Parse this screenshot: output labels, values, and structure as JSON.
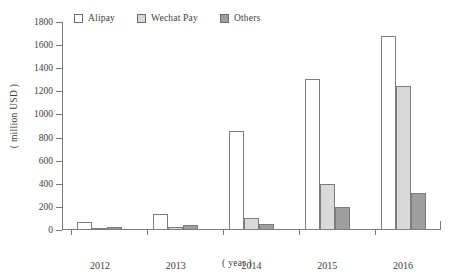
{
  "chart_data": {
    "type": "bar",
    "title": "",
    "subtitle": "",
    "xlabel": "( year )",
    "ylabel": "( million USD )",
    "categories": [
      "2012",
      "2013",
      "2014",
      "2015",
      "2016"
    ],
    "series": [
      {
        "name": "Alipay",
        "values": [
          70,
          140,
          860,
          1310,
          1680
        ]
      },
      {
        "name": "Wechat Pay",
        "values": [
          15,
          30,
          100,
          400,
          1250
        ]
      },
      {
        "name": "Others",
        "values": [
          30,
          40,
          50,
          200,
          320
        ]
      }
    ],
    "ylim": [
      0,
      1800
    ],
    "ytick_values": [
      0,
      200,
      400,
      600,
      800,
      1000,
      1200,
      1400,
      1600,
      1800
    ],
    "ytick_labels": [
      "0",
      "200",
      "400",
      "600",
      "800",
      "1000",
      "1200",
      "1400",
      "1600",
      "1800"
    ],
    "grid": false,
    "legend_position": "top-left",
    "colors": {
      "alipay": "#ffffff",
      "wechat": "#d9d9d9",
      "others": "#9e9e9e",
      "axis": "#7a7a7a",
      "text": "#3d3d3d",
      "background": "#ffffff"
    }
  },
  "legend": {
    "items": [
      {
        "label": "Alipay",
        "swatch": "alipay"
      },
      {
        "label": "Wechat Pay",
        "swatch": "wechat"
      },
      {
        "label": "Others",
        "swatch": "others"
      }
    ]
  }
}
